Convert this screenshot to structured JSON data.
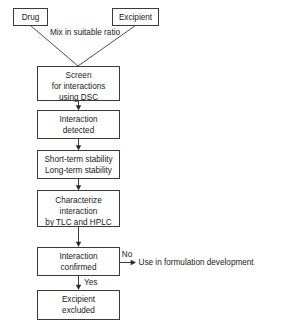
{
  "diagram": {
    "colors": {
      "background": "#ffffff",
      "box_stroke": "#3a3a3a",
      "box_fill": "#ffffff",
      "text": "#1a1a1a",
      "arrow": "#2a2a2a"
    },
    "inputs": [
      {
        "id": "drug",
        "label": "Drug"
      },
      {
        "id": "excipient",
        "label": "Excipient"
      }
    ],
    "merge_label": "Mix in suitable ratio",
    "steps": [
      {
        "id": "screen",
        "lines": [
          "Screen",
          "for interactions",
          "using DSC"
        ]
      },
      {
        "id": "interaction-detected",
        "lines": [
          "Interaction",
          "detected"
        ]
      },
      {
        "id": "stability",
        "lines": [
          "Short-term stability",
          "Long-term stability"
        ]
      },
      {
        "id": "characterize",
        "lines": [
          "Characterize",
          "interaction",
          "by TLC and HPLC"
        ]
      },
      {
        "id": "interaction-confirmed",
        "lines": [
          "Interaction",
          "confirmed"
        ]
      },
      {
        "id": "excipient-excluded",
        "lines": [
          "Excipient",
          "excluded"
        ]
      }
    ],
    "branches": {
      "no": {
        "label": "No",
        "outcome": "Use in formulation development"
      },
      "yes": {
        "label": "Yes"
      }
    },
    "caption": ""
  }
}
